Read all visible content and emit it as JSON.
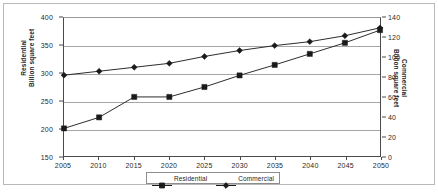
{
  "chart_data": {
    "type": "line",
    "title": "",
    "subtitle": "",
    "xlabel": "",
    "grid": true,
    "legend_position": "bottom",
    "x": [
      2005,
      2010,
      2015,
      2020,
      2025,
      2030,
      2035,
      2040,
      2045,
      2050
    ],
    "x_tick_labels": [
      "2005",
      "2010",
      "2015",
      "2020",
      "2025",
      "2030",
      "2035",
      "2040",
      "2045",
      "2050"
    ],
    "axes": {
      "left": {
        "label_line1": "Residential",
        "label_line2": "Billion square feet",
        "ylim": [
          150,
          400
        ],
        "ticks": [
          150,
          200,
          250,
          300,
          350,
          400
        ],
        "tick_labels": [
          "150",
          "200",
          "250",
          "300",
          "350",
          "400"
        ]
      },
      "right": {
        "label_line1": "Commercial",
        "label_line2": "Billion square feet",
        "ylim": [
          0,
          140
        ],
        "ticks": [
          0,
          20,
          40,
          60,
          80,
          100,
          120,
          140
        ],
        "tick_labels": [
          "0",
          "20",
          "40",
          "60",
          "80",
          "100",
          "120",
          "140"
        ]
      }
    },
    "series": [
      {
        "name": "Residential",
        "axis": "left",
        "marker": "square",
        "color": "#1a1a1a",
        "values": [
          200,
          220,
          257,
          257,
          275,
          296,
          315,
          335,
          355,
          378
        ]
      },
      {
        "name": "Commercial",
        "axis": "right",
        "marker": "diamond",
        "color": "#1a1a1a",
        "values": [
          82,
          86,
          90,
          94,
          101,
          107,
          112,
          116,
          122,
          130
        ]
      }
    ]
  },
  "legend": {
    "items": [
      {
        "label": "Residential"
      },
      {
        "label": "Commercial"
      }
    ]
  }
}
